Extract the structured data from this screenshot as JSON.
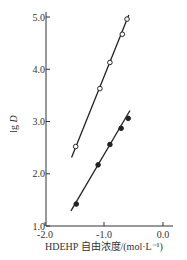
{
  "chart_data": {
    "type": "scatter",
    "title": "",
    "xlabel": "HDEHP 自由浓度/(mol·L⁻¹)",
    "ylabel_main": "lg ",
    "ylabel_italic": "D",
    "xlim": [
      -2.0,
      0.1
    ],
    "ylim": [
      1.0,
      5.0
    ],
    "x_ticks": [
      {
        "value": -2.0,
        "label": "-2.0"
      },
      {
        "value": -1.0,
        "label": "-1.0"
      },
      {
        "value": 0.0,
        "label": "0.0"
      }
    ],
    "y_ticks": [
      {
        "value": 1.0,
        "label": "1.0"
      },
      {
        "value": 2.0,
        "label": "2.0"
      },
      {
        "value": 3.0,
        "label": "3.0"
      },
      {
        "value": 4.0,
        "label": "4.0"
      },
      {
        "value": 5.0,
        "label": "5.0"
      }
    ],
    "grid": false,
    "legend": null,
    "series": [
      {
        "name": "open circles",
        "marker": "open-circle",
        "x": [
          -1.48,
          -1.07,
          -0.9,
          -0.69,
          -0.61
        ],
        "y": [
          2.52,
          3.63,
          4.13,
          4.67,
          4.96
        ],
        "fit_line": {
          "x": [
            -1.55,
            -0.58
          ],
          "y": [
            2.31,
            5.04
          ]
        }
      },
      {
        "name": "filled circles",
        "marker": "filled-circle",
        "x": [
          -1.47,
          -1.1,
          -0.9,
          -0.71,
          -0.59
        ],
        "y": [
          1.42,
          2.17,
          2.56,
          2.87,
          3.06
        ],
        "fit_line": {
          "x": [
            -1.56,
            -0.56
          ],
          "y": [
            1.29,
            3.21
          ]
        }
      }
    ]
  }
}
